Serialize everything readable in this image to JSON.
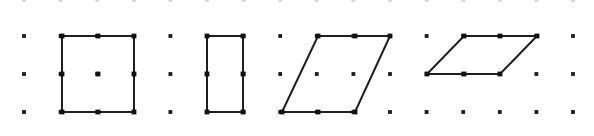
{
  "figure": {
    "width": 594,
    "height": 136,
    "background_color": "#ffffff"
  },
  "grid": {
    "name": "dot-lattice",
    "columns": 16,
    "rows": 4,
    "origin_x": 24,
    "origin_y": 0,
    "spacing_x": 36.6,
    "spacing_y": 37.8,
    "row_y_values": [
      0,
      36,
      74,
      112
    ],
    "dot_radius": 1.9,
    "dot_color": "#1a1a1a",
    "clipped_top_row": true,
    "clipped_top_row_color": "#d8d8dc"
  },
  "shapes": [
    {
      "name": "square",
      "label": "Square",
      "stroke_color": "#1f1f1f",
      "stroke_width": 2,
      "fill": "none",
      "points": [
        [
          62,
          36
        ],
        [
          134,
          36
        ],
        [
          134,
          112
        ],
        [
          62,
          112
        ]
      ],
      "grid_cells_wide": 2,
      "grid_cells_tall": 2
    },
    {
      "name": "rectangle",
      "label": "Rectangle",
      "stroke_color": "#1f1f1f",
      "stroke_width": 2,
      "fill": "none",
      "points": [
        [
          207,
          36
        ],
        [
          243,
          36
        ],
        [
          243,
          112
        ],
        [
          207,
          112
        ]
      ],
      "grid_cells_wide": 1,
      "grid_cells_tall": 2
    },
    {
      "name": "parallelogram-tall",
      "label": "Parallelogram",
      "stroke_color": "#1f1f1f",
      "stroke_width": 2,
      "fill": "none",
      "points": [
        [
          318,
          36
        ],
        [
          390,
          36
        ],
        [
          355,
          112
        ],
        [
          282,
          112
        ]
      ],
      "grid_cells_wide": 2,
      "grid_cells_tall": 2
    },
    {
      "name": "parallelogram-wide",
      "label": "Parallelogram",
      "stroke_color": "#1f1f1f",
      "stroke_width": 2,
      "fill": "none",
      "points": [
        [
          464,
          36
        ],
        [
          537,
          36
        ],
        [
          500,
          74
        ],
        [
          427,
          74
        ]
      ],
      "grid_cells_wide": 2,
      "grid_cells_tall": 1
    }
  ],
  "marked_points": {
    "name": "vertex-markers",
    "radius": 2.4,
    "color": "#111111",
    "coordinates": [
      [
        62,
        36
      ],
      [
        98,
        36
      ],
      [
        134,
        36
      ],
      [
        62,
        74
      ],
      [
        98,
        74
      ],
      [
        134,
        74
      ],
      [
        62,
        112
      ],
      [
        98,
        112
      ],
      [
        134,
        112
      ],
      [
        207,
        36
      ],
      [
        243,
        36
      ],
      [
        207,
        74
      ],
      [
        243,
        74
      ],
      [
        207,
        112
      ],
      [
        243,
        112
      ],
      [
        318,
        36
      ],
      [
        355,
        36
      ],
      [
        390,
        36
      ],
      [
        282,
        112
      ],
      [
        318,
        112
      ],
      [
        355,
        112
      ],
      [
        464,
        36
      ],
      [
        500,
        36
      ],
      [
        537,
        36
      ],
      [
        427,
        74
      ],
      [
        464,
        74
      ],
      [
        500,
        74
      ]
    ]
  }
}
